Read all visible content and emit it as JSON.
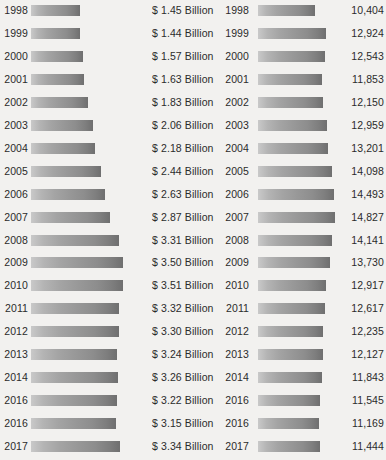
{
  "chart_data": [
    {
      "id": "left",
      "type": "bar",
      "orientation": "horizontal",
      "title": "",
      "xlabel": "",
      "ylabel": "",
      "grid": false,
      "legend": null,
      "value_unit": "Billion",
      "value_prefix": "$",
      "xlim": [
        0,
        3.6
      ],
      "categories": [
        "1998",
        "1999",
        "2000",
        "2001",
        "2002",
        "2003",
        "2004",
        "2005",
        "2006",
        "2007",
        "2008",
        "2009",
        "2010",
        "2011",
        "2012",
        "2013",
        "2014",
        "2016",
        "2016",
        "2017"
      ],
      "values": [
        1.45,
        1.44,
        1.57,
        1.63,
        1.83,
        2.06,
        2.18,
        2.44,
        2.63,
        2.87,
        3.31,
        3.5,
        3.51,
        3.32,
        3.3,
        3.24,
        3.26,
        3.22,
        3.15,
        3.34
      ],
      "value_labels": [
        "$ 1.45 Billion",
        "$ 1.44 Billion",
        "$ 1.57 Billion",
        "$ 1.63 Billion",
        "$ 1.83 Billion",
        "$ 2.06 Billion",
        "$ 2.18 Billion",
        "$ 2.44 Billion",
        "$ 2.63 Billion",
        "$ 2.87 Billion",
        "$ 3.31  Billion",
        "$ 3.50 Billion",
        "$ 3.51 Billion",
        "$ 3.32  Billion",
        "$ 3.30 Billion",
        "$ 3.24 Billion",
        "$ 3.26 Billion",
        "$ 3.22 Billion",
        "$ 3.15 Billion",
        "$ 3.34 Billion"
      ]
    },
    {
      "id": "right",
      "type": "bar",
      "orientation": "horizontal",
      "title": "",
      "xlabel": "",
      "ylabel": "",
      "grid": false,
      "legend": null,
      "value_unit": "",
      "value_prefix": "",
      "xlim": [
        0,
        15000
      ],
      "categories": [
        "1998",
        "1999",
        "2000",
        "2001",
        "2002",
        "2003",
        "2004",
        "2005",
        "2006",
        "2007",
        "2008",
        "2009",
        "2010",
        "2011",
        "2012",
        "2013",
        "2014",
        "2016",
        "2016",
        "2017"
      ],
      "values": [
        10404,
        12924,
        12543,
        11853,
        12150,
        12959,
        13201,
        14098,
        14493,
        14827,
        14141,
        13730,
        12917,
        12617,
        12235,
        12127,
        11843,
        11545,
        11169,
        11444
      ],
      "value_labels": [
        "10,404",
        "12,924",
        "12,543",
        "11,853",
        "12,150",
        "12,959",
        "13,201",
        "14,098",
        "14,493",
        "14,827",
        "14,141",
        "13,730",
        "12,917",
        "12,617",
        "12,235",
        "12,127",
        "11,843",
        "11,545",
        "11,169",
        "11,444"
      ]
    }
  ],
  "style": {
    "background": "#f2f1ef",
    "text_color": "#2b2b2b",
    "bar_gradient_start": "#c9c9c9",
    "bar_gradient_end": "#6f6f6f"
  }
}
